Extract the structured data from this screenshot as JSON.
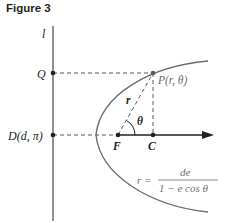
{
  "figure": {
    "title": "Figure 3",
    "directrix_label": "l",
    "points": {
      "Q": {
        "label": "Q"
      },
      "D": {
        "label_prefix": "D",
        "label_args": "(d, π)"
      },
      "P": {
        "label_prefix": "P",
        "label_args": "(r, θ)"
      },
      "F": {
        "label": "F"
      },
      "C": {
        "label": "C"
      }
    },
    "segment_labels": {
      "r": "r",
      "theta": "θ"
    },
    "equation": {
      "lhs": "r =",
      "numerator": "de",
      "denominator": "1 − e cos θ"
    },
    "colors": {
      "ink": "#231f20",
      "curve": "#6d6e71",
      "dashed": "#58595b"
    }
  }
}
